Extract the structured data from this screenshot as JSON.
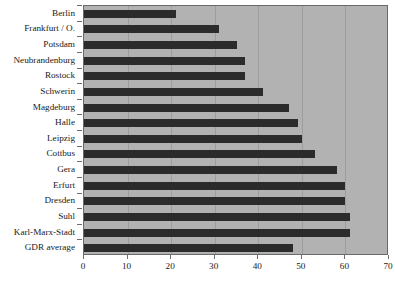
{
  "chart_data": {
    "type": "bar",
    "orientation": "horizontal",
    "title": "",
    "subtitle": "",
    "xlabel": "",
    "ylabel": "",
    "xlim": [
      0,
      70
    ],
    "xticks": [
      0,
      10,
      20,
      30,
      40,
      50,
      60,
      70
    ],
    "xticklabels": [
      "0",
      "10",
      "20",
      "30",
      "40",
      "50",
      "60",
      "70"
    ],
    "grid": "vertical",
    "legend": null,
    "categories": [
      "Berlin",
      "Frankfurt / O.",
      "Potsdam",
      "Neubrandenburg",
      "Rostock",
      "Schwerin",
      "Magdeburg",
      "Halle",
      "Leipzig",
      "Cottbus",
      "Gera",
      "Erfurt",
      "Dresden",
      "Suhl",
      "Karl-Marx-Stadt",
      "GDR average"
    ],
    "values": [
      21,
      31,
      35,
      37,
      37,
      41,
      47,
      49,
      50,
      53,
      58,
      60,
      60,
      61,
      61,
      48
    ],
    "colors": {
      "bar": "#2b2b2b",
      "plot_background": "#b2b2b2",
      "gridline": "#9d9d9d",
      "axis": "#6a6a6a",
      "text": "#1a1a1a",
      "page_background": "#ffffff"
    }
  }
}
